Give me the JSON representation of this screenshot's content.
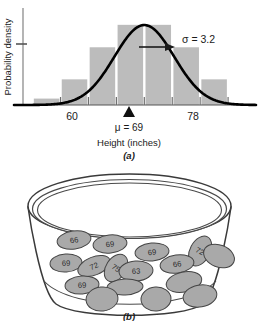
{
  "figure": {
    "panel_a": {
      "caption": "(a)",
      "xlabel": "Height (inches)",
      "ylabel": "Probability density",
      "mean_label": "μ = 69",
      "sigma_label": "σ = 3.2",
      "xtick_labels": [
        "60",
        "78"
      ]
    },
    "panel_b": {
      "caption": "(b)",
      "tickets": [
        {
          "value": "66",
          "cx": 74,
          "cy": 240,
          "rx": 17,
          "ry": 9,
          "rot": -8
        },
        {
          "value": "69",
          "cx": 110,
          "cy": 244,
          "rx": 17,
          "ry": 9,
          "rot": -6
        },
        {
          "value": "69",
          "cx": 152,
          "cy": 252,
          "rx": 17,
          "ry": 9,
          "rot": -5
        },
        {
          "value": "72",
          "cx": 200,
          "cy": 251,
          "rx": 10,
          "ry": 16,
          "rot": 28
        },
        {
          "value": "",
          "cx": 219,
          "cy": 256,
          "rx": 16,
          "ry": 11,
          "rot": 22
        },
        {
          "value": "69",
          "cx": 66,
          "cy": 263,
          "rx": 16,
          "ry": 9,
          "rot": -4
        },
        {
          "value": "72",
          "cx": 94,
          "cy": 266,
          "rx": 17,
          "ry": 9,
          "rot": -22
        },
        {
          "value": "75",
          "cx": 116,
          "cy": 268,
          "rx": 10,
          "ry": 15,
          "rot": 33
        },
        {
          "value": "63",
          "cx": 136,
          "cy": 271,
          "rx": 17,
          "ry": 10,
          "rot": -4
        },
        {
          "value": "66",
          "cx": 177,
          "cy": 264,
          "rx": 17,
          "ry": 9,
          "rot": -8
        },
        {
          "value": "69",
          "cx": 82,
          "cy": 285,
          "rx": 17,
          "ry": 9,
          "rot": -4
        },
        {
          "value": "",
          "cx": 125,
          "cy": 287,
          "rx": 18,
          "ry": 8,
          "rot": -3
        },
        {
          "value": "",
          "cx": 184,
          "cy": 282,
          "rx": 18,
          "ry": 10,
          "rot": -12
        },
        {
          "value": "",
          "cx": 102,
          "cy": 299,
          "rx": 16,
          "ry": 12,
          "rot": -6
        },
        {
          "value": "",
          "cx": 156,
          "cy": 299,
          "rx": 15,
          "ry": 12,
          "rot": -4
        },
        {
          "value": "",
          "cx": 200,
          "cy": 296,
          "rx": 17,
          "ry": 11,
          "rot": -10
        }
      ]
    }
  },
  "chart_data": {
    "type": "bar",
    "title": "",
    "subtitle": "",
    "xlabel": "Height (inches)",
    "ylabel": "Probability density",
    "categories": [
      "58.5",
      "61.5",
      "64.5",
      "67.5",
      "70.5",
      "73.5",
      "76.5"
    ],
    "bin_edges": [
      57,
      60,
      63,
      66,
      69,
      72,
      75,
      78
    ],
    "values": [
      0.01,
      0.04,
      0.09,
      0.125,
      0.125,
      0.09,
      0.04
    ],
    "bar_color": "#bcbcbc",
    "xlim": [
      55,
      81
    ],
    "ylim": [
      0,
      0.145
    ],
    "xticks": [
      60,
      63,
      66,
      69,
      72,
      75,
      78
    ],
    "xtick_labels_shown": [
      "60",
      "78"
    ],
    "yticks": [
      0.09
    ],
    "grid": false,
    "legend": false,
    "annotations": [
      {
        "text": "σ = 3.2",
        "x": 73.5,
        "y": 0.095
      },
      {
        "text": "μ = 69",
        "x": 69,
        "y": 0
      }
    ],
    "overlay_curve": {
      "type": "normal",
      "mean": 69,
      "sd": 3.2,
      "color": "#000000",
      "name": "normal density curve"
    }
  }
}
